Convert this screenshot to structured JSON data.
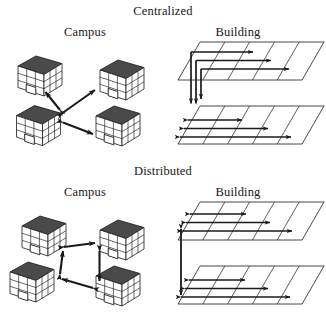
{
  "figure": {
    "caption_present": false,
    "background_color": "#ffffff",
    "ink_color": "#1a1a1a",
    "roof_color": "#4a4a4a",
    "wall_color": "#ffffff",
    "sections": [
      {
        "id": "centralized",
        "title": "Centralized",
        "title_x": 163,
        "title_y": 11,
        "columns": [
          {
            "id": "campus",
            "label": "Campus",
            "label_x": 85,
            "label_y": 33
          },
          {
            "id": "building",
            "label": "Building",
            "label_x": 238,
            "label_y": 33
          }
        ],
        "campus": {
          "topology": "star",
          "hub_index": 2,
          "buildings": [
            {
              "id": "b1",
              "x": 18,
              "y": 56,
              "w": 44,
              "h": 40,
              "size": "small"
            },
            {
              "id": "b2",
              "x": 100,
              "y": 62,
              "w": 42,
              "h": 38,
              "size": "small"
            },
            {
              "id": "b3",
              "x": 12,
              "y": 102,
              "w": 52,
              "h": 46,
              "size": "large"
            },
            {
              "id": "b4",
              "x": 96,
              "y": 108,
              "w": 44,
              "h": 40,
              "size": "small"
            }
          ],
          "links": [
            {
              "from": "hub",
              "to": "b1",
              "style": "double-arrow"
            },
            {
              "from": "hub",
              "to": "b2",
              "style": "double-arrow"
            },
            {
              "from": "hub",
              "to": "b4",
              "style": "double-arrow"
            }
          ]
        },
        "building": {
          "topology": "vertical-backbone-with-horizontal-runs",
          "floors": [
            {
              "id": "upper-floor",
              "runs": 3,
              "run_direction": "right"
            },
            {
              "id": "lower-floor",
              "runs": 3,
              "run_direction": "both"
            }
          ],
          "risers": 3,
          "riser_direction": "down"
        }
      },
      {
        "id": "distributed",
        "title": "Distributed",
        "title_x": 163,
        "title_y": 171,
        "columns": [
          {
            "id": "campus",
            "label": "Campus",
            "label_x": 85,
            "label_y": 192
          },
          {
            "id": "building",
            "label": "Building",
            "label_x": 238,
            "label_y": 192
          }
        ],
        "campus": {
          "topology": "ring",
          "hub_index": null,
          "buildings": [
            {
              "id": "b1",
              "x": 20,
              "y": 216,
              "w": 46,
              "h": 42,
              "size": "small"
            },
            {
              "id": "b2",
              "x": 100,
              "y": 222,
              "w": 44,
              "h": 40,
              "size": "small"
            },
            {
              "id": "b3",
              "x": 12,
              "y": 262,
              "w": 50,
              "h": 44,
              "size": "large"
            },
            {
              "id": "b4",
              "x": 96,
              "y": 268,
              "w": 48,
              "h": 44,
              "size": "large"
            }
          ],
          "links": [
            {
              "from": "b1",
              "to": "b2",
              "style": "double-arrow"
            },
            {
              "from": "b2",
              "to": "b4",
              "style": "double-arrow"
            },
            {
              "from": "b4",
              "to": "b3",
              "style": "double-arrow"
            },
            {
              "from": "b3",
              "to": "b1",
              "style": "double-arrow"
            }
          ]
        },
        "building": {
          "topology": "per-floor-horizontal-with-single-riser",
          "floors": [
            {
              "id": "upper-floor",
              "runs": 3,
              "run_direction": "both"
            },
            {
              "id": "lower-floor",
              "runs": 3,
              "run_direction": "both"
            }
          ],
          "risers": 1,
          "riser_direction": "both"
        }
      }
    ]
  }
}
